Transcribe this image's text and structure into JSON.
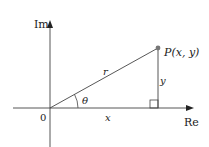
{
  "diagram": {
    "axes": {
      "vertical_label": "Im",
      "horizontal_label": "Re",
      "origin_label": "0"
    },
    "point": {
      "label": "P(x, y)"
    },
    "segments": {
      "radius_label": "r",
      "horizontal_leg_label": "x",
      "vertical_leg_label": "y"
    },
    "angle_label": "θ",
    "colors": {
      "line": "#444444",
      "point": "#777777",
      "background": "#ffffff"
    }
  }
}
